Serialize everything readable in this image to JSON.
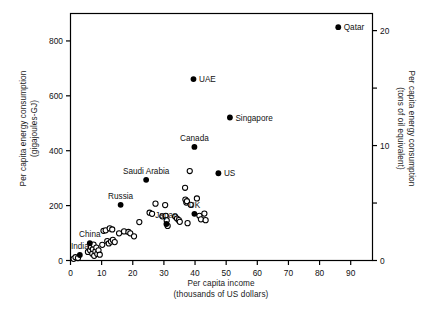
{
  "figure": {
    "background": "#ffffff",
    "frame_color": "#000000",
    "width": 425,
    "height": 319
  },
  "axes": {
    "left": {
      "title_line1": "Per capita energy consumption",
      "title_line2": "(gigajoules-GJ)",
      "ticks": [
        0,
        200,
        400,
        600,
        800
      ],
      "range": [
        0,
        900
      ]
    },
    "right": {
      "title_line1": "Per capita energy consumption",
      "title_line2": "(tons of oil equivalent)",
      "ticks": [
        0,
        10,
        20
      ],
      "minor_ticks": [
        5,
        15
      ],
      "range": [
        0,
        21.49
      ]
    },
    "bottom": {
      "title_line1": "Per capita income",
      "title_line2": "(thousands of US dollars)",
      "ticks": [
        0,
        10,
        20,
        30,
        40,
        50,
        60,
        70,
        80,
        90
      ],
      "range": [
        0,
        97
      ]
    }
  },
  "chart_data": {
    "type": "scatter",
    "title": "",
    "xlabel": "Per capita income (thousands of US dollars)",
    "ylabel": "Per capita energy consumption (gigajoules-GJ)",
    "ylabel_right": "Per capita energy consumption (tons of oil equivalent)",
    "xlim": [
      0,
      97
    ],
    "ylim": [
      0,
      900
    ],
    "ylim_right": [
      0,
      21.49
    ],
    "grid": false,
    "legend": "none",
    "marker_styles": {
      "labeled": "filled-circle",
      "unlabeled": "open-circle"
    },
    "labeled_points": [
      {
        "name": "Qatar",
        "x": 86.0,
        "y": 850,
        "label_pos": "right"
      },
      {
        "name": "UAE",
        "x": 39.5,
        "y": 661,
        "label_pos": "right"
      },
      {
        "name": "Singapore",
        "x": 51.2,
        "y": 521,
        "label_pos": "right"
      },
      {
        "name": "Canada",
        "x": 39.8,
        "y": 414,
        "label_pos": "above"
      },
      {
        "name": "US",
        "x": 47.5,
        "y": 318,
        "label_pos": "right"
      },
      {
        "name": "Saudi Arabia",
        "x": 24.3,
        "y": 294,
        "label_pos": "above"
      },
      {
        "name": "Russia",
        "x": 16.1,
        "y": 203,
        "label_pos": "above"
      },
      {
        "name": "UK",
        "x": 39.8,
        "y": 170,
        "label_pos": "above"
      },
      {
        "name": "Japan",
        "x": 30.8,
        "y": 133,
        "label_pos": "above"
      },
      {
        "name": "China",
        "x": 6.2,
        "y": 63,
        "label_pos": "above"
      },
      {
        "name": "India",
        "x": 3.0,
        "y": 20,
        "label_pos": "above"
      }
    ],
    "unlabeled_points": [
      {
        "x": 1.0,
        "y": 6
      },
      {
        "x": 1.6,
        "y": 12
      },
      {
        "x": 2.4,
        "y": 9
      },
      {
        "x": 5.6,
        "y": 31
      },
      {
        "x": 6.3,
        "y": 37
      },
      {
        "x": 6.6,
        "y": 49
      },
      {
        "x": 7.0,
        "y": 25
      },
      {
        "x": 7.2,
        "y": 41
      },
      {
        "x": 7.4,
        "y": 58
      },
      {
        "x": 7.6,
        "y": 17
      },
      {
        "x": 8.0,
        "y": 33
      },
      {
        "x": 8.3,
        "y": 47
      },
      {
        "x": 8.6,
        "y": 24
      },
      {
        "x": 9.0,
        "y": 37
      },
      {
        "x": 9.4,
        "y": 21
      },
      {
        "x": 10.2,
        "y": 57
      },
      {
        "x": 10.6,
        "y": 108
      },
      {
        "x": 11.3,
        "y": 110
      },
      {
        "x": 11.8,
        "y": 71
      },
      {
        "x": 12.3,
        "y": 62
      },
      {
        "x": 12.6,
        "y": 117
      },
      {
        "x": 13.0,
        "y": 69
      },
      {
        "x": 13.4,
        "y": 113
      },
      {
        "x": 13.6,
        "y": 75
      },
      {
        "x": 14.2,
        "y": 67
      },
      {
        "x": 15.6,
        "y": 99
      },
      {
        "x": 17.2,
        "y": 106
      },
      {
        "x": 18.6,
        "y": 104
      },
      {
        "x": 19.2,
        "y": 99
      },
      {
        "x": 20.4,
        "y": 88
      },
      {
        "x": 22.1,
        "y": 140
      },
      {
        "x": 25.4,
        "y": 174
      },
      {
        "x": 26.2,
        "y": 170
      },
      {
        "x": 27.3,
        "y": 207
      },
      {
        "x": 29.5,
        "y": 161
      },
      {
        "x": 30.4,
        "y": 202
      },
      {
        "x": 30.6,
        "y": 163
      },
      {
        "x": 30.9,
        "y": 146
      },
      {
        "x": 31.2,
        "y": 126
      },
      {
        "x": 33.6,
        "y": 160
      },
      {
        "x": 34.2,
        "y": 153
      },
      {
        "x": 34.8,
        "y": 147
      },
      {
        "x": 35.1,
        "y": 141
      },
      {
        "x": 36.8,
        "y": 265
      },
      {
        "x": 36.9,
        "y": 222
      },
      {
        "x": 37.2,
        "y": 211
      },
      {
        "x": 37.4,
        "y": 216
      },
      {
        "x": 37.6,
        "y": 136
      },
      {
        "x": 38.3,
        "y": 326
      },
      {
        "x": 38.6,
        "y": 203
      },
      {
        "x": 40.6,
        "y": 226
      },
      {
        "x": 41.4,
        "y": 163
      },
      {
        "x": 41.9,
        "y": 150
      },
      {
        "x": 43.0,
        "y": 171
      },
      {
        "x": 43.4,
        "y": 147
      }
    ]
  }
}
